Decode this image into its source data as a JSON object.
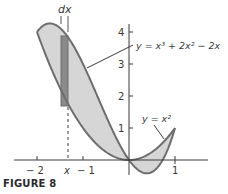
{
  "figure": {
    "caption": "FIGURE 8",
    "labels": {
      "dx": "dx",
      "cubic_eq": "y = x³ + 2x² − 2x",
      "parabola_eq": "y = x²",
      "x_marker": "x"
    },
    "colors": {
      "region_fill": "#d6d6d6",
      "curve_stroke": "#6e6e6e",
      "strip_fill": "#8a8a8a",
      "axis": "#3a3a3a"
    }
  },
  "chart_data": {
    "type": "area",
    "title": "FIGURE 8",
    "xlabel": "",
    "ylabel": "",
    "xlim": [
      -2.6,
      1.9
    ],
    "ylim": [
      -0.6,
      4.6
    ],
    "grid": false,
    "x_ticks": [
      {
        "value": -2,
        "label": "− 2"
      },
      {
        "value": -1,
        "label": "− 1"
      },
      {
        "value": 1,
        "label": "1"
      }
    ],
    "y_ticks": [
      {
        "value": 1,
        "label": "1"
      },
      {
        "value": 2,
        "label": "2"
      },
      {
        "value": 3,
        "label": "3"
      },
      {
        "value": 4,
        "label": "4"
      }
    ],
    "series": [
      {
        "name": "y = x³ + 2x² − 2x",
        "formula": "x^3+2x^2-2x",
        "x": [
          -2,
          -1.5,
          -1,
          -0.5,
          0,
          0.25,
          0.5,
          0.75,
          1
        ],
        "values": [
          4,
          4.125,
          3,
          1.375,
          0,
          -0.328,
          -0.375,
          0.047,
          1
        ]
      },
      {
        "name": "y = x²",
        "formula": "x^2",
        "x": [
          -2,
          -1.5,
          -1,
          -0.5,
          0,
          0.25,
          0.5,
          0.75,
          1
        ],
        "values": [
          4,
          2.25,
          1,
          0.25,
          0,
          0.0625,
          0.25,
          0.5625,
          1
        ]
      }
    ],
    "intersections": [
      [
        -2,
        4
      ],
      [
        0,
        0
      ],
      [
        1,
        1
      ]
    ],
    "shaded_region": "between curves on [-2, 1]",
    "annotations": [
      {
        "text": "dx",
        "note": "width of representative strip"
      },
      {
        "text": "x",
        "note": "strip location, approx -1.33"
      }
    ]
  }
}
